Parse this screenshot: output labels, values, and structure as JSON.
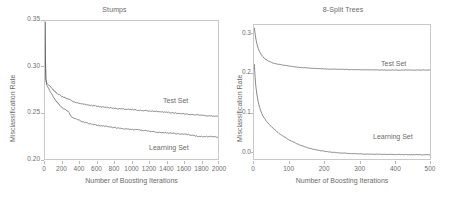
{
  "figure": {
    "width": 457,
    "height": 197,
    "background": "#ffffff",
    "line_color": "#555555",
    "frame_color": "#c9c9c9",
    "text_color": "#6a6a6a"
  },
  "panels": [
    {
      "id": "stumps",
      "title": "Stumps",
      "xlabel": "Number of Boosting Iterations",
      "ylabel": "Misclassification Rate",
      "xticks": [
        "0",
        "200",
        "400",
        "600",
        "800",
        "1000",
        "1200",
        "1400",
        "1600",
        "1800",
        "2000"
      ],
      "yticks": [
        "0.20",
        "0.25",
        "0.30",
        "0.35"
      ],
      "series_labels": [
        {
          "name": "test-set-label",
          "text": "Test Set"
        },
        {
          "name": "learning-set-label",
          "text": "Learning Set"
        }
      ]
    },
    {
      "id": "eight-split-trees",
      "title": "8-Split Trees",
      "xlabel": "Number of Boosting Iterations",
      "ylabel": "Misclassification Rate",
      "xticks": [
        "0",
        "100",
        "200",
        "300",
        "400",
        "500"
      ],
      "yticks": [
        "0.0",
        "0.1",
        "0.2",
        "0.3"
      ],
      "series_labels": [
        {
          "name": "test-set-label",
          "text": "Test Set"
        },
        {
          "name": "learning-set-label",
          "text": "Learning Set"
        }
      ]
    }
  ],
  "chart_data": [
    {
      "type": "line",
      "title": "Stumps",
      "xlabel": "Number of Boosting Iterations",
      "ylabel": "Misclassification Rate",
      "xlim": [
        0,
        2000
      ],
      "ylim": [
        0.2,
        0.38
      ],
      "xticks": [
        0,
        200,
        400,
        600,
        800,
        1000,
        1200,
        1400,
        1600,
        1800,
        2000
      ],
      "yticks": [
        0.2,
        0.25,
        0.3,
        0.35
      ],
      "grid": false,
      "legend": "inline-annotations",
      "series": [
        {
          "name": "Test Set",
          "x": [
            1,
            5,
            10,
            20,
            30,
            40,
            50,
            60,
            80,
            100,
            130,
            160,
            200,
            240,
            280,
            320,
            360,
            400,
            450,
            500,
            560,
            620,
            700,
            780,
            860,
            940,
            1020,
            1100,
            1180,
            1260,
            1340,
            1420,
            1500,
            1580,
            1660,
            1740,
            1820,
            1900,
            1980,
            2000
          ],
          "values": [
            0.379,
            0.33,
            0.305,
            0.299,
            0.2975,
            0.2965,
            0.296,
            0.2945,
            0.292,
            0.2895,
            0.2865,
            0.284,
            0.2815,
            0.2795,
            0.2775,
            0.2755,
            0.2735,
            0.2725,
            0.2715,
            0.2705,
            0.2695,
            0.2685,
            0.2675,
            0.2665,
            0.2655,
            0.2648,
            0.2642,
            0.2635,
            0.2628,
            0.2622,
            0.2615,
            0.2608,
            0.26,
            0.2592,
            0.2585,
            0.2578,
            0.257,
            0.2562,
            0.2556,
            0.2555
          ]
        },
        {
          "name": "Learning Set",
          "x": [
            1,
            5,
            10,
            20,
            30,
            40,
            50,
            60,
            80,
            100,
            130,
            160,
            200,
            240,
            280,
            300,
            320,
            360,
            400,
            450,
            500,
            560,
            620,
            700,
            780,
            860,
            940,
            1020,
            1100,
            1180,
            1260,
            1340,
            1420,
            1500,
            1580,
            1660,
            1740,
            1800,
            1860,
            1920,
            2000
          ],
          "values": [
            0.379,
            0.33,
            0.303,
            0.2965,
            0.2945,
            0.2925,
            0.29,
            0.2875,
            0.284,
            0.2805,
            0.2755,
            0.2715,
            0.267,
            0.264,
            0.2605,
            0.256,
            0.2545,
            0.252,
            0.25,
            0.248,
            0.2465,
            0.245,
            0.2438,
            0.2425,
            0.2412,
            0.24,
            0.2392,
            0.2385,
            0.2378,
            0.2368,
            0.2355,
            0.2348,
            0.234,
            0.2332,
            0.2325,
            0.2318,
            0.23,
            0.2292,
            0.2295,
            0.229,
            0.2288
          ]
        }
      ]
    },
    {
      "type": "line",
      "title": "8-Split Trees",
      "xlabel": "Number of Boosting Iterations",
      "ylabel": "Misclassification Rate",
      "xlim": [
        0,
        500
      ],
      "ylim": [
        -0.01,
        0.315
      ],
      "xticks": [
        0,
        100,
        200,
        300,
        400,
        500
      ],
      "yticks": [
        0.0,
        0.1,
        0.2,
        0.3
      ],
      "grid": false,
      "legend": "inline-annotations",
      "series": [
        {
          "name": "Test Set",
          "x": [
            1,
            3,
            5,
            8,
            12,
            16,
            20,
            25,
            30,
            40,
            50,
            60,
            70,
            85,
            100,
            115,
            130,
            150,
            170,
            190,
            210,
            240,
            270,
            300,
            330,
            360,
            390,
            420,
            450,
            480,
            500
          ],
          "values": [
            0.308,
            0.295,
            0.283,
            0.27,
            0.258,
            0.25,
            0.244,
            0.238,
            0.234,
            0.228,
            0.224,
            0.2215,
            0.2195,
            0.2175,
            0.2155,
            0.2135,
            0.2122,
            0.211,
            0.2098,
            0.209,
            0.2082,
            0.2075,
            0.207,
            0.2065,
            0.2062,
            0.206,
            0.2058,
            0.2058,
            0.2057,
            0.2056,
            0.2055
          ]
        },
        {
          "name": "Learning Set",
          "x": [
            1,
            3,
            5,
            8,
            12,
            16,
            20,
            25,
            30,
            40,
            50,
            60,
            70,
            85,
            100,
            115,
            130,
            150,
            170,
            190,
            210,
            240,
            270,
            300,
            330,
            360,
            390,
            420,
            450,
            480,
            500
          ],
          "values": [
            0.22,
            0.19,
            0.168,
            0.148,
            0.128,
            0.115,
            0.105,
            0.095,
            0.088,
            0.077,
            0.068,
            0.06,
            0.053,
            0.044,
            0.036,
            0.03,
            0.024,
            0.018,
            0.013,
            0.01,
            0.0075,
            0.005,
            0.0035,
            0.0025,
            0.0018,
            0.0013,
            0.001,
            0.0008,
            0.0006,
            0.0004,
            0.0003
          ]
        }
      ]
    }
  ]
}
